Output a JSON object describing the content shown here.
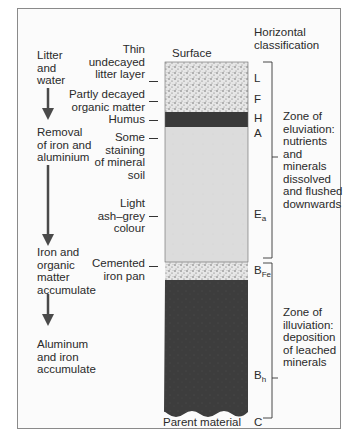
{
  "diagram": {
    "type": "soil-profile-podzol",
    "header": {
      "surface": "Surface",
      "horizontal_classification": "Horizontal\nclassification"
    },
    "left_process": [
      {
        "text": "Litter\nand\nwater"
      },
      {
        "text": "Removal\nof iron and\naluminium"
      },
      {
        "text": "Iron and\norganic\nmatter\naccumulate"
      },
      {
        "text": "Aluminum\nand iron\naccumulate"
      }
    ],
    "column_labels": [
      {
        "text": "Thin\nundecayed\nlitter layer"
      },
      {
        "text": "Partly decayed\norganic matter"
      },
      {
        "text": "Humus"
      },
      {
        "text": "Some\nstaining\nof mineral\nsoil"
      },
      {
        "text": "Light\nash–grey\ncolour"
      },
      {
        "text": "Cemented\niron pan"
      },
      {
        "text": "Parent material"
      }
    ],
    "horizons": [
      {
        "code": "L",
        "sub": ""
      },
      {
        "code": "F",
        "sub": ""
      },
      {
        "code": "H",
        "sub": ""
      },
      {
        "code": "A",
        "sub": ""
      },
      {
        "code": "E",
        "sub": "a"
      },
      {
        "code": "B",
        "sub": "Fe"
      },
      {
        "code": "B",
        "sub": "h"
      },
      {
        "code": "C",
        "sub": ""
      }
    ],
    "zones": [
      {
        "text": "Zone of\neluviation:\nnutrients\nand\nminerals\ndissolved\nand flushed\ndownwards"
      },
      {
        "text": "Zone of\nilluviation:\ndeposition\nof leached\nminerals"
      }
    ],
    "colors": {
      "stipple_light": "#e2e2e2",
      "humus_dark": "#3a3a3a",
      "ash_grey": "#dcdcdc",
      "illuvial_dark": "#3d3d3d",
      "arrow": "#4a4a4a",
      "frame": "#8a8a8a"
    }
  }
}
